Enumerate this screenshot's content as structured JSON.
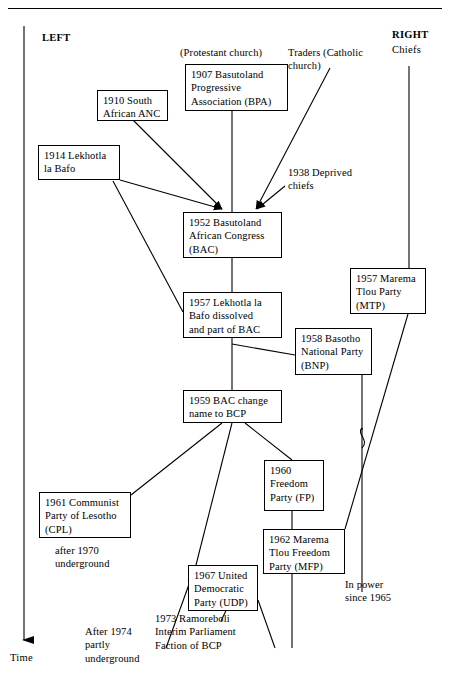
{
  "diagram": {
    "axis": {
      "time_label": "Time",
      "left_label": "LEFT",
      "right_label": "RIGHT",
      "right_sub_label": "Chiefs"
    },
    "sources": [
      {
        "id": "protestant",
        "text": "(Protestant church)"
      },
      {
        "id": "traders",
        "text": "Traders  (Catholic\n          church)"
      }
    ],
    "nodes": [
      {
        "id": "bpa",
        "text": "1907  Basutoland\nProgressive\nAssociation (BPA)"
      },
      {
        "id": "anc",
        "text": "1910 South\nAfrican ANC"
      },
      {
        "id": "llb",
        "text": "1914  Lekhotla\nla Bafo"
      },
      {
        "id": "bac",
        "text": "1952  Basutoland\nAfrican Congress\n(BAC)"
      },
      {
        "id": "llb57",
        "text": "1957  Lekhotla la\nBafo dissolved\nand part of BAC"
      },
      {
        "id": "mtp",
        "text": "1957  Marema\nTlou Party\n(MTP)"
      },
      {
        "id": "bnp",
        "text": "1958  Basotho\nNational Party\n(BNP)"
      },
      {
        "id": "bcp",
        "text": "1959  BAC change\nname to BCP"
      },
      {
        "id": "cpl",
        "text": "1961  Communist\nParty of Lesotho\n(CPL)"
      },
      {
        "id": "fp",
        "text": "1960\nFreedom\nParty (FP)"
      },
      {
        "id": "mfp",
        "text": "1962  Marema\nTlou Freedom\nParty (MFP)"
      },
      {
        "id": "udp",
        "text": "1967  United\nDemocratic\nParty (UDP)"
      }
    ],
    "annotations": [
      {
        "id": "deprived-chiefs",
        "text": "1938  Deprived\nchiefs"
      },
      {
        "id": "cpl-underground",
        "text": "after 1970\nunderground"
      },
      {
        "id": "bcp-underground",
        "text": "After 1974\npartly\nunderground"
      },
      {
        "id": "ramoreboli",
        "text": "1973  Ramoreboli\nInterim Parliament\nFaction of BCP"
      },
      {
        "id": "in-power",
        "text": "In power\nsince 1965"
      }
    ],
    "colors": {
      "ink": "#000000",
      "paper": "#ffffff"
    }
  }
}
